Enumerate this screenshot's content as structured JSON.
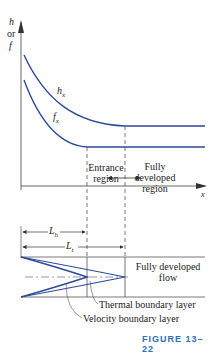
{
  "diagram": {
    "y_axis": {
      "label_line1": "h",
      "label_line2": "or",
      "label_line3": "f"
    },
    "x_axis": {
      "label": "x"
    },
    "curves": [
      {
        "name": "h_x",
        "label": "h",
        "subscript": "x"
      },
      {
        "name": "f_x",
        "label": "f",
        "subscript": "x"
      }
    ],
    "regions": {
      "entrance_line1": "Entrance",
      "entrance_line2": "region",
      "developed_line1": "Fully",
      "developed_line2": "developed",
      "developed_line3": "region"
    },
    "lengths": {
      "hydrodynamic": {
        "label": "L",
        "subscript": "h"
      },
      "thermal": {
        "label": "L",
        "subscript": "t"
      }
    },
    "flow": {
      "developed_line1": "Fully developed",
      "developed_line2": "flow",
      "thermal_bl": "Thermal boundary layer",
      "velocity_bl": "Velocity boundary layer"
    },
    "caption": "FIGURE 13–22",
    "colors": {
      "curve": "#2b4a9a",
      "axis": "#555555",
      "text": "#222222"
    }
  }
}
